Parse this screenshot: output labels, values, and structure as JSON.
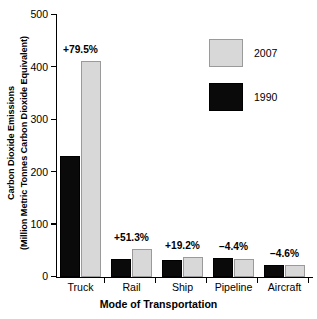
{
  "chart_data": {
    "type": "bar",
    "title": "",
    "xlabel": "Mode of Transportation",
    "ylabel_line1": "Carbon Dioxide Emissions",
    "ylabel_line2": "(Million Metric Tonnes Carbon Dioxide Equivalent)",
    "categories": [
      "Truck",
      "Rail",
      "Ship",
      "Pipeline",
      "Aircraft"
    ],
    "series": [
      {
        "name": "1990",
        "color": "#0a0a0a",
        "values": [
          231,
          34,
          32,
          36,
          23
        ]
      },
      {
        "name": "2007",
        "color": "#d8d8d8",
        "values": [
          412,
          53,
          38,
          34,
          22
        ]
      }
    ],
    "annotations": [
      "+79.5%",
      "+51.3%",
      "+19.2%",
      "−4.4%",
      "−4.6%"
    ],
    "ylim": [
      0,
      500
    ],
    "yticks": [
      0,
      100,
      200,
      300,
      400,
      500
    ],
    "ytick_labels": [
      "0",
      "100",
      "200",
      "300",
      "400",
      "500"
    ],
    "grid": false,
    "legend_position": "upper-right-inside",
    "legend": [
      {
        "label": "2007",
        "swatch": "light"
      },
      {
        "label": "1990",
        "swatch": "dark"
      }
    ]
  }
}
